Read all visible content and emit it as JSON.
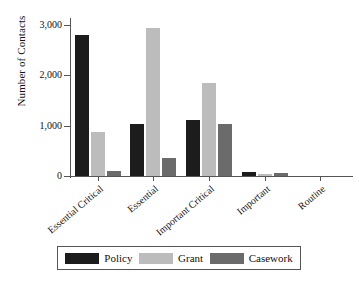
{
  "chart_data": {
    "type": "bar",
    "title": "",
    "subtitle": "",
    "xlabel": "",
    "ylabel": "Number of Contacts",
    "ylim": [
      0,
      3100
    ],
    "yticks": [
      0,
      1000,
      2000,
      3000
    ],
    "ytick_labels": [
      "0",
      "1,000",
      "2,000",
      "3,000"
    ],
    "grid": false,
    "legend_position": "bottom",
    "categories": [
      "Essential Critical",
      "Essential",
      "Important Critical",
      "Important",
      "Routine"
    ],
    "series": [
      {
        "name": "Policy",
        "color": "#1c1c1c",
        "values": [
          2800,
          1030,
          1110,
          70,
          0
        ]
      },
      {
        "name": "Grant",
        "color": "#bcbcbc",
        "values": [
          880,
          2940,
          1840,
          40,
          0
        ]
      },
      {
        "name": "Casework",
        "color": "#6b6b6b",
        "values": [
          100,
          350,
          1040,
          60,
          0
        ]
      }
    ]
  },
  "axes": {
    "y_title": "Number of Contacts",
    "axis_color": "#555555"
  },
  "legend": {
    "items": [
      {
        "label": "Policy",
        "color": "#1c1c1c"
      },
      {
        "label": "Grant",
        "color": "#bcbcbc"
      },
      {
        "label": "Casework",
        "color": "#6b6b6b"
      }
    ]
  }
}
